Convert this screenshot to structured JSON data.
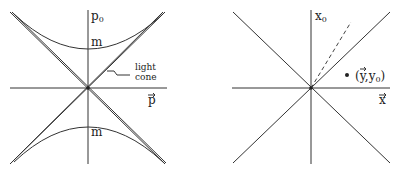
{
  "left_diagram": {
    "vertical_axis_label": "p",
    "vertical_axis_subscript": "0",
    "horizontal_axis_label": "p",
    "upper_mass_label": "m",
    "lower_mass_label": "m",
    "light_cone_label_line1": "light",
    "light_cone_label_line2": "cone"
  },
  "right_diagram": {
    "vertical_axis_label": "x",
    "vertical_axis_subscript": "0",
    "horizontal_axis_label": "x",
    "point_label": "(y,y",
    "point_label_subscript": "0",
    "point_label_close": ")"
  },
  "colors": {
    "line": "#333333",
    "text": "#222222",
    "background": "#ffffff"
  }
}
